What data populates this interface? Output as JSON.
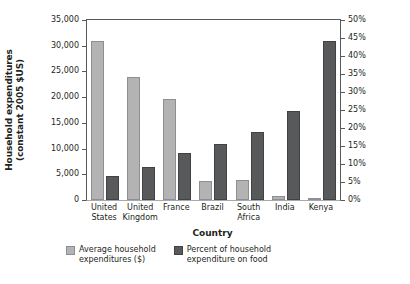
{
  "chart_data": {
    "type": "bar",
    "title": "",
    "xlabel": "Country",
    "ylabel_left_line1": "Household expenditures",
    "ylabel_left_line2": "(constant 2005 $US)",
    "ylabel_right": "",
    "grid": false,
    "legend_position": "bottom",
    "categories": [
      "United States",
      "United Kingdom",
      "France",
      "Brazil",
      "South Africa",
      "India",
      "Kenya"
    ],
    "category_lines": [
      [
        "United",
        "States"
      ],
      [
        "United",
        "Kingdom"
      ],
      [
        "France",
        ""
      ],
      [
        "Brazil",
        ""
      ],
      [
        "South",
        "Africa"
      ],
      [
        "India",
        ""
      ],
      [
        "Kenya",
        ""
      ]
    ],
    "series": [
      {
        "name": "Average household expenditures ($)",
        "name_lines": [
          "Average household",
          "expenditures ($)"
        ],
        "axis": "left",
        "color": "#b3b3b3",
        "values": [
          30900,
          23900,
          19640,
          3700,
          3800,
          700,
          350
        ]
      },
      {
        "name": "Percent of household expenditure on food",
        "name_lines": [
          "Percent of household",
          "expenditure on food"
        ],
        "axis": "right",
        "color": "#58595b",
        "values": [
          6.6,
          9.2,
          13.1,
          15.6,
          18.9,
          24.7,
          44.2
        ]
      }
    ],
    "left_axis": {
      "min": 0,
      "max": 35000,
      "step": 5000,
      "ticks": [
        0,
        5000,
        10000,
        15000,
        20000,
        25000,
        30000,
        35000
      ],
      "tick_labels": [
        "0",
        "5,000",
        "10,000",
        "15,000",
        "20,000",
        "25,000",
        "30,000",
        "35,000"
      ]
    },
    "right_axis": {
      "min": 0,
      "max": 50,
      "step": 5,
      "ticks": [
        0,
        5,
        10,
        15,
        20,
        25,
        30,
        35,
        40,
        45,
        50
      ],
      "tick_labels": [
        "0%",
        "5%",
        "10%",
        "15%",
        "20%",
        "25%",
        "30%",
        "35%",
        "40%",
        "45%",
        "50%"
      ]
    }
  }
}
